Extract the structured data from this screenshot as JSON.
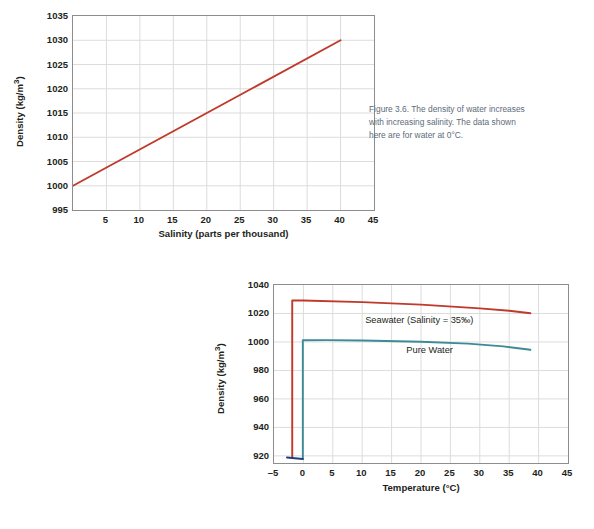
{
  "page": {
    "background": "#ffffff",
    "figure_count": 2
  },
  "figure36": {
    "caption_lines": [
      "Figure 3.6.  The density of water increases",
      "with increasing salinity. The data shown",
      "here are for water at 0°C."
    ],
    "caption_color": "#5d6b7a"
  },
  "figure37": {
    "caption_lines": [
      "Figure 3.7.  At any given temperature,",
      "seawater is denser than freshwater.",
      "Seawater freezes at a lower temperature",
      "than freshwater."
    ],
    "caption_color": "#5d6b7a"
  },
  "chart_data": [
    {
      "id": "density-vs-salinity",
      "type": "line",
      "title": "",
      "xlabel": "Salinity (parts per thousand)",
      "ylabel": "Density (kg/m³)",
      "xlim": [
        0,
        45
      ],
      "ylim": [
        995,
        1035
      ],
      "xticks": [
        5,
        10,
        15,
        20,
        25,
        30,
        35,
        40,
        45
      ],
      "yticks": [
        995,
        1000,
        1005,
        1010,
        1015,
        1020,
        1025,
        1030,
        1035
      ],
      "grid": true,
      "legend": "none",
      "series": [
        {
          "name": "Density of water at 0°C",
          "color": "#c0392b",
          "x": [
            0,
            40
          ],
          "values": [
            1000,
            1030
          ]
        }
      ]
    },
    {
      "id": "density-vs-temperature",
      "type": "line",
      "title": "",
      "xlabel": "Temperature (°C)",
      "ylabel": "Density (kg/m³)",
      "xlim": [
        -5,
        45
      ],
      "ylim": [
        915,
        1040
      ],
      "xticks": [
        -5,
        0,
        5,
        10,
        15,
        20,
        25,
        30,
        35,
        40,
        45
      ],
      "yticks": [
        920,
        940,
        960,
        980,
        1000,
        1020,
        1040
      ],
      "grid": true,
      "legend": "inline-labels",
      "annotations": [
        {
          "text": "Seawater (Salinity = 35‰)",
          "x": 10.5,
          "y": 1015
        },
        {
          "text": "Pure Water",
          "x": 17.5,
          "y": 994
        },
        {
          "text": "Ice",
          "x": -2.6,
          "y": 912
        }
      ],
      "series": [
        {
          "name": "Seawater (Salinity = 35‰)",
          "color": "#c0392b",
          "x": [
            -1.9,
            -1.9,
            0,
            10,
            20,
            30,
            35,
            38.6
          ],
          "values": [
            918.5,
            1029.2,
            1029.1,
            1028.0,
            1026.2,
            1023.6,
            1021.9,
            1020.2
          ]
        },
        {
          "name": "Pure Water",
          "color": "#3d8b96",
          "x": [
            -0.1,
            -0.1,
            4,
            10,
            20,
            28,
            34,
            38.6
          ],
          "values": [
            917.8,
            1001.2,
            1001.3,
            1001.0,
            1000.2,
            998.8,
            996.9,
            994.5
          ]
        },
        {
          "name": "Ice",
          "color": "#1f3f7a",
          "x": [
            -2.8,
            -0.1
          ],
          "values": [
            918.9,
            917.8
          ]
        }
      ]
    }
  ]
}
